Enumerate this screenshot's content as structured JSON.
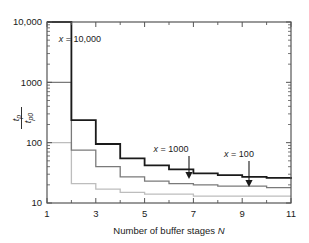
{
  "chart_data": {
    "type": "line",
    "title": "",
    "xlabel": "Number of buffer stages N",
    "ylabel": "tp/tp0",
    "xlabel_plain": "Number of buffer stages ",
    "xlabel_italic": "N",
    "ylabel_num_main": "t",
    "ylabel_num_sub": "p",
    "ylabel_den_main": "t",
    "ylabel_den_sub": "p0",
    "xscale": "linear",
    "yscale": "log",
    "xlim": [
      1,
      11
    ],
    "ylim": [
      10,
      10000
    ],
    "grid": false,
    "legend": "none",
    "xticks": [
      1,
      3,
      5,
      7,
      9,
      11
    ],
    "xtick_labels": [
      "1",
      "3",
      "5",
      "7",
      "9",
      "11"
    ],
    "xticks_minor": [
      2,
      4,
      6,
      8,
      10
    ],
    "yticks": [
      10,
      100,
      1000,
      10000
    ],
    "ytick_labels": [
      "10",
      "100",
      "1000",
      "10,000"
    ],
    "step_style": "post",
    "x": [
      1,
      2,
      3,
      4,
      5,
      6,
      7,
      8,
      9,
      10,
      11
    ],
    "series": [
      {
        "name": "x = 10,000",
        "color": "#1a1a1a",
        "linewidth": 1.8,
        "values": [
          10000,
          237,
          95,
          55,
          42,
          36,
          31,
          29,
          27,
          26,
          25
        ]
      },
      {
        "name": "x = 1000",
        "color": "#7a7a7a",
        "linewidth": 1.3,
        "values": [
          1000,
          75,
          40,
          27,
          23,
          21,
          20,
          19,
          19,
          18,
          18
        ]
      },
      {
        "name": "x = 100",
        "color": "#bdbdbd",
        "linewidth": 1.3,
        "values": [
          100,
          21,
          17,
          15,
          14,
          14,
          13,
          13,
          13,
          13,
          13
        ]
      }
    ],
    "annotations": [
      {
        "id": "anno-x-10000",
        "text": "x = 10,000",
        "var": "x",
        "rest": " = 10,000",
        "has_arrow": false,
        "text_x": 80,
        "text_y": 42
      },
      {
        "id": "anno-x-1000",
        "text": "x = 1000",
        "var": "x",
        "rest": " = 1000",
        "has_arrow": true,
        "text_x": 171,
        "text_y": 152,
        "arrow_x": 189,
        "arrow_y0": 156,
        "arrow_y1": 179
      },
      {
        "id": "anno-x-100",
        "text": "x = 100",
        "var": "x",
        "rest": " = 100",
        "has_arrow": true,
        "text_x": 239,
        "text_y": 157,
        "arrow_x": 249,
        "arrow_y0": 161,
        "arrow_y1": 187
      }
    ]
  },
  "axes": {
    "frame_color": "#555555",
    "background": "#ffffff"
  }
}
